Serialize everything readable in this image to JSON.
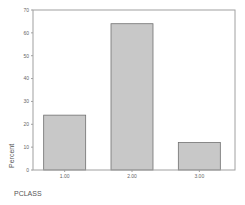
{
  "chart_data": {
    "type": "bar",
    "title": "",
    "categories": [
      "1.00",
      "2.00",
      "3.00"
    ],
    "values": [
      24,
      64,
      12
    ],
    "xlabel": "PCLASS",
    "ylabel": "Percent",
    "ylim": [
      0,
      70
    ],
    "yticks": [
      0,
      10,
      20,
      30,
      40,
      50,
      60,
      70
    ],
    "grid": false,
    "legend": null,
    "bar_color": "#c8c8c8",
    "bar_edge_color": "#707070",
    "frame_color": "#a0a0a0"
  }
}
